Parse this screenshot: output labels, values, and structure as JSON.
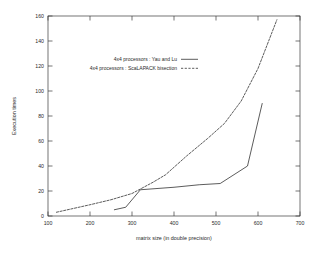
{
  "chart_data": {
    "type": "line",
    "title": "",
    "xlabel": "matrix size (in double precision)",
    "ylabel": "Execution times",
    "xlim": [
      100,
      700
    ],
    "ylim": [
      0,
      160
    ],
    "xticks": [
      100,
      200,
      300,
      400,
      500,
      600,
      700
    ],
    "yticks": [
      0,
      20,
      40,
      60,
      80,
      100,
      120,
      140,
      160
    ],
    "grid": false,
    "legend_position": "upper-left-inside",
    "series": [
      {
        "name": "4x4 processors : Yau and Lu",
        "style": "solid",
        "x": [
          258,
          285,
          320,
          400,
          460,
          510,
          575,
          610
        ],
        "y": [
          5,
          7,
          21,
          23,
          25,
          26,
          40,
          90
        ]
      },
      {
        "name": "4x4 processors : ScaLAPACK bisection",
        "style": "dashed",
        "x": [
          120,
          160,
          200,
          250,
          300,
          350,
          380,
          430,
          480,
          520,
          560,
          600,
          645
        ],
        "y": [
          3,
          6,
          9,
          13,
          18,
          27,
          33,
          48,
          62,
          74,
          92,
          118,
          157
        ]
      }
    ]
  },
  "axes": {
    "y_title": "Execution times",
    "x_title": "matrix size (in double precision)",
    "x_tick_labels": [
      "100",
      "200",
      "300",
      "400",
      "500",
      "600",
      "700"
    ],
    "y_tick_labels": [
      "0",
      "20",
      "40",
      "60",
      "80",
      "100",
      "120",
      "140",
      "160"
    ]
  },
  "legend": {
    "entries": [
      {
        "label": "4x4 processors : Yau and Lu",
        "style": "solid"
      },
      {
        "label": "4x4 processors : ScaLAPACK bisection",
        "style": "dashed"
      }
    ]
  }
}
